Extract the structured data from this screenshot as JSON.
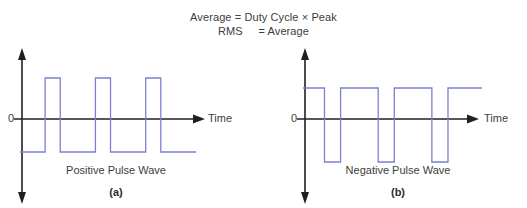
{
  "figure": {
    "background": "#ffffff",
    "formula": {
      "line1": "Average = Duty Cycle × Peak",
      "line2": "RMS     = Average"
    },
    "axis_color": "#231f20",
    "wave_color": "#7b80d2",
    "panels": [
      {
        "id": "a",
        "sub_label": "(a)",
        "caption": "Positive Pulse Wave",
        "zero_label": "0",
        "time_label": "Time",
        "x_axis_arrow": "arrow-right-icon",
        "y_axis_arrow_up": "arrow-up-icon",
        "y_axis_arrow_down": "arrow-down-icon"
      },
      {
        "id": "b",
        "sub_label": "(b)",
        "caption": "Negative Pulse Wave",
        "zero_label": "0",
        "time_label": "Time",
        "x_axis_arrow": "arrow-right-icon",
        "y_axis_arrow_up": "arrow-up-icon",
        "y_axis_arrow_down": "arrow-down-icon"
      }
    ]
  },
  "chart_data": [
    {
      "type": "line",
      "title": "Positive Pulse Wave",
      "subtitle": "(a)",
      "xlabel": "Time",
      "ylabel": "",
      "grid": false,
      "legend": "none",
      "annotations": [
        "0"
      ],
      "description": "Rectangular positive pulse wave: baseline sits below zero, three narrow pulses rise above zero. Low duty cycle.",
      "levels": {
        "high": 1,
        "low": -1,
        "zero": 0
      },
      "duty_cycle": 0.3,
      "series": [
        {
          "name": "positive-pulse",
          "x": [
            0,
            30,
            30,
            48,
            48,
            90,
            90,
            108,
            108,
            150,
            150,
            168,
            168,
            210
          ],
          "y": [
            -1,
            -1,
            1,
            1,
            -1,
            -1,
            1,
            1,
            -1,
            -1,
            1,
            1,
            -1,
            -1
          ]
        }
      ],
      "xlim": [
        0,
        230
      ],
      "ylim": [
        -1.6,
        1.6
      ]
    },
    {
      "type": "line",
      "title": "Negative Pulse Wave",
      "subtitle": "(b)",
      "xlabel": "Time",
      "ylabel": "",
      "grid": false,
      "legend": "none",
      "annotations": [
        "0"
      ],
      "description": "Rectangular negative pulse wave: baseline sits above zero, three narrow pulses drop below zero. High duty cycle.",
      "levels": {
        "high": 1,
        "low": -1,
        "zero": 0
      },
      "duty_cycle": 0.7,
      "series": [
        {
          "name": "negative-pulse",
          "x": [
            0,
            24,
            24,
            42,
            42,
            84,
            84,
            102,
            102,
            144,
            144,
            162,
            162,
            200
          ],
          "y": [
            1,
            1,
            -1,
            -1,
            1,
            1,
            -1,
            -1,
            1,
            1,
            -1,
            -1,
            1,
            1
          ]
        }
      ],
      "xlim": [
        0,
        220
      ],
      "ylim": [
        -1.6,
        1.6
      ]
    }
  ]
}
